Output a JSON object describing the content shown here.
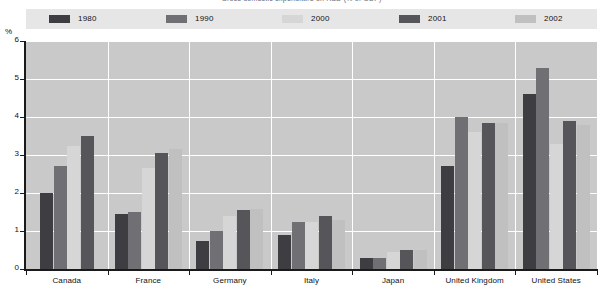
{
  "title": "Gross domestic expenditure on R&D (% of GDP)",
  "axis": {
    "y_unit": "%",
    "y_ticks": [
      "0",
      "1",
      "2",
      "3",
      "4",
      "5",
      "6"
    ]
  },
  "legend": [
    {
      "label": "1980",
      "color": "#3d3d42"
    },
    {
      "label": "1990",
      "color": "#6f6f74"
    },
    {
      "label": "2000",
      "color": "#d6d6d6"
    },
    {
      "label": "2001",
      "color": "#55555a"
    },
    {
      "label": "2002",
      "color": "#c0c0c0"
    }
  ],
  "chart_data": {
    "type": "bar",
    "title": "Gross domestic expenditure on R&D (% of GDP)",
    "xlabel": "",
    "ylabel": "%",
    "ylim": [
      0,
      6
    ],
    "yticks": [
      0,
      1,
      2,
      3,
      4,
      5,
      6
    ],
    "grid": "horizontal-and-group-separators",
    "legend_position": "top",
    "categories": [
      "Canada",
      "France",
      "Germany",
      "Italy",
      "Japan",
      "United Kingdom",
      "United States"
    ],
    "series": [
      {
        "name": "1980",
        "color": "#3d3d42",
        "values": [
          2.0,
          1.45,
          0.75,
          0.9,
          0.3,
          2.7,
          4.6
        ]
      },
      {
        "name": "1990",
        "color": "#6f6f74",
        "values": [
          2.7,
          1.5,
          1.0,
          1.25,
          0.3,
          4.0,
          5.3
        ]
      },
      {
        "name": "2000",
        "color": "#d6d6d6",
        "values": [
          3.25,
          2.65,
          1.4,
          1.25,
          0.45,
          3.6,
          3.3
        ]
      },
      {
        "name": "2001",
        "color": "#55555a",
        "values": [
          3.5,
          3.05,
          1.55,
          1.4,
          0.5,
          3.85,
          3.9
        ]
      },
      {
        "name": "2002",
        "color": "#c0c0c0",
        "values": [
          null,
          3.15,
          1.57,
          1.3,
          0.5,
          3.85,
          3.8
        ]
      }
    ]
  }
}
